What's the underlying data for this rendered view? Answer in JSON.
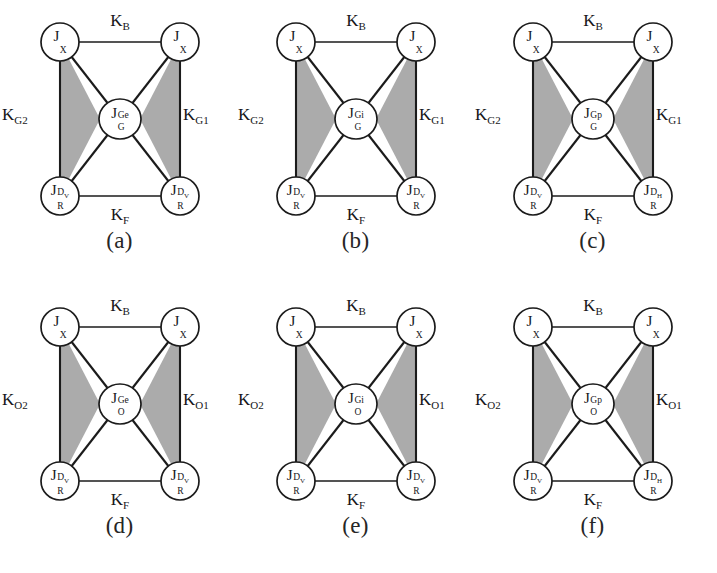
{
  "figure": {
    "background": "#ffffff",
    "shade_color": "#ababab",
    "line_color": "#1b1b1b",
    "node_fill": "#ffffff"
  },
  "panels": [
    {
      "caption": "(a)",
      "center": {
        "base": "J",
        "sup": "Ge",
        "sub": "G"
      },
      "nodes": {
        "top_left": {
          "base": "J",
          "sup": "",
          "sub": "X"
        },
        "top_right": {
          "base": "J",
          "sup": "",
          "sub": "X"
        },
        "bottom_left": {
          "base": "J",
          "sup": "D",
          "sup_small": "V",
          "sub": "R"
        },
        "bottom_right": {
          "base": "J",
          "sup": "D",
          "sup_small": "V",
          "sub": "R"
        }
      },
      "edges": {
        "top": {
          "base": "K",
          "sub": "B"
        },
        "left": {
          "base": "K",
          "sub": "G2"
        },
        "right": {
          "base": "K",
          "sub": "G1"
        },
        "bottom": {
          "base": "K",
          "sub": "F"
        }
      }
    },
    {
      "caption": "(b)",
      "center": {
        "base": "J",
        "sup": "Gi",
        "sub": "G"
      },
      "nodes": {
        "top_left": {
          "base": "J",
          "sup": "",
          "sub": "X"
        },
        "top_right": {
          "base": "J",
          "sup": "",
          "sub": "X"
        },
        "bottom_left": {
          "base": "J",
          "sup": "D",
          "sup_small": "V",
          "sub": "R"
        },
        "bottom_right": {
          "base": "J",
          "sup": "D",
          "sup_small": "V",
          "sub": "R"
        }
      },
      "edges": {
        "top": {
          "base": "K",
          "sub": "B"
        },
        "left": {
          "base": "K",
          "sub": "G2"
        },
        "right": {
          "base": "K",
          "sub": "G1"
        },
        "bottom": {
          "base": "K",
          "sub": "F"
        }
      }
    },
    {
      "caption": "(c)",
      "center": {
        "base": "J",
        "sup": "Gp",
        "sub": "G"
      },
      "nodes": {
        "top_left": {
          "base": "J",
          "sup": "",
          "sub": "X"
        },
        "top_right": {
          "base": "J",
          "sup": "",
          "sub": "X"
        },
        "bottom_left": {
          "base": "J",
          "sup": "D",
          "sup_small": "V",
          "sub": "R"
        },
        "bottom_right": {
          "base": "J",
          "sup": "D",
          "sup_small": "H",
          "sub": "R"
        }
      },
      "edges": {
        "top": {
          "base": "K",
          "sub": "B"
        },
        "left": {
          "base": "K",
          "sub": "G2"
        },
        "right": {
          "base": "K",
          "sub": "G1"
        },
        "bottom": {
          "base": "K",
          "sub": "F"
        }
      }
    },
    {
      "caption": "(d)",
      "center": {
        "base": "J",
        "sup": "Ge",
        "sub": "O"
      },
      "nodes": {
        "top_left": {
          "base": "J",
          "sup": "",
          "sub": "X"
        },
        "top_right": {
          "base": "J",
          "sup": "",
          "sub": "X"
        },
        "bottom_left": {
          "base": "J",
          "sup": "D",
          "sup_small": "V",
          "sub": "R"
        },
        "bottom_right": {
          "base": "J",
          "sup": "D",
          "sup_small": "V",
          "sub": "R"
        }
      },
      "edges": {
        "top": {
          "base": "K",
          "sub": "B"
        },
        "left": {
          "base": "K",
          "sub": "O2"
        },
        "right": {
          "base": "K",
          "sub": "O1"
        },
        "bottom": {
          "base": "K",
          "sub": "F"
        }
      }
    },
    {
      "caption": "(e)",
      "center": {
        "base": "J",
        "sup": "Gi",
        "sub": "O"
      },
      "nodes": {
        "top_left": {
          "base": "J",
          "sup": "",
          "sub": "X"
        },
        "top_right": {
          "base": "J",
          "sup": "",
          "sub": "X"
        },
        "bottom_left": {
          "base": "J",
          "sup": "D",
          "sup_small": "V",
          "sub": "R"
        },
        "bottom_right": {
          "base": "J",
          "sup": "D",
          "sup_small": "V",
          "sub": "R"
        }
      },
      "edges": {
        "top": {
          "base": "K",
          "sub": "B"
        },
        "left": {
          "base": "K",
          "sub": "O2"
        },
        "right": {
          "base": "K",
          "sub": "O1"
        },
        "bottom": {
          "base": "K",
          "sub": "F"
        }
      }
    },
    {
      "caption": "(f)",
      "center": {
        "base": "J",
        "sup": "Gp",
        "sub": "O"
      },
      "nodes": {
        "top_left": {
          "base": "J",
          "sup": "",
          "sub": "X"
        },
        "top_right": {
          "base": "J",
          "sup": "",
          "sub": "X"
        },
        "bottom_left": {
          "base": "J",
          "sup": "D",
          "sup_small": "V",
          "sub": "R"
        },
        "bottom_right": {
          "base": "J",
          "sup": "D",
          "sup_small": "H",
          "sub": "R"
        }
      },
      "edges": {
        "top": {
          "base": "K",
          "sub": "B"
        },
        "left": {
          "base": "K",
          "sub": "O2"
        },
        "right": {
          "base": "K",
          "sub": "O1"
        },
        "bottom": {
          "base": "K",
          "sub": "F"
        }
      }
    }
  ]
}
